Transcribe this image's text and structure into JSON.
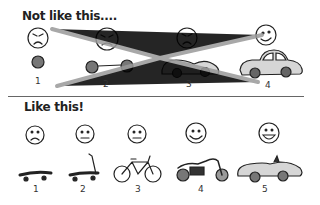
{
  "top": {
    "title": "Not like this....",
    "numbers": [
      "1",
      "2",
      "3",
      "4"
    ]
  },
  "bottom": {
    "title": "Like this!",
    "numbers": [
      "1",
      "2",
      "3",
      "4",
      "5"
    ]
  },
  "colors": {
    "strike": "#999999",
    "car_fill": "#d6d6d6",
    "line": "#222222"
  }
}
